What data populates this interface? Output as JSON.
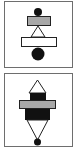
{
  "diagram": {
    "panels": [
      {
        "id": "panel-1",
        "description": "stack: small dot, gray bar, triangle, white bar, large dot",
        "components": [
          {
            "kind": "circle",
            "role": "small-dot-top",
            "fill": "#111111"
          },
          {
            "kind": "rect",
            "role": "gray-bar",
            "fill": "#a8a8a8"
          },
          {
            "kind": "triangle",
            "role": "connector-triangle",
            "fill": "#ffffff"
          },
          {
            "kind": "rect",
            "role": "white-bar",
            "fill": "#ffffff"
          },
          {
            "kind": "circle",
            "role": "large-dot-bottom",
            "fill": "#111111"
          }
        ]
      },
      {
        "id": "panel-2",
        "description": "symmetric stack: triangle, black block, gray bar, black block, inverted triangle, dot",
        "components": [
          {
            "kind": "triangle",
            "role": "top-triangle",
            "fill": "#ffffff"
          },
          {
            "kind": "rect",
            "role": "upper-black-block",
            "fill": "#111111"
          },
          {
            "kind": "rect",
            "role": "gray-bar",
            "fill": "#a8a8a8"
          },
          {
            "kind": "rect",
            "role": "lower-black-block",
            "fill": "#111111"
          },
          {
            "kind": "triangle",
            "role": "bottom-triangle",
            "fill": "#ffffff"
          },
          {
            "kind": "circle",
            "role": "small-dot-bottom",
            "fill": "#111111"
          }
        ]
      }
    ],
    "colors": {
      "frame": "#6e6e6e",
      "stroke": "#222222",
      "black": "#111111",
      "gray": "#a8a8a8",
      "white": "#ffffff"
    }
  }
}
